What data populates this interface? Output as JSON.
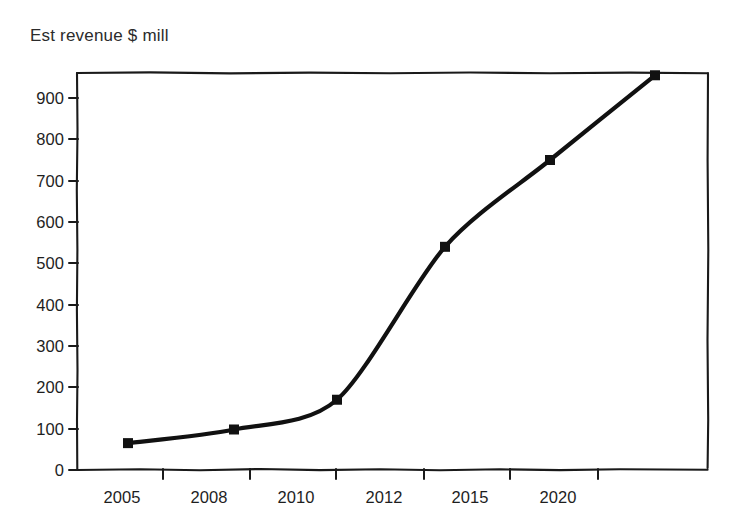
{
  "chart_data": {
    "type": "line",
    "title": "Est revenue $ mill",
    "xlabel": "",
    "ylabel": "",
    "categories": [
      "2005",
      "2008",
      "2010",
      "2012",
      "2015",
      "2020"
    ],
    "values": [
      65,
      98,
      170,
      540,
      750,
      955
    ],
    "series": [
      {
        "name": "Est revenue $ mill",
        "values": [
          65,
          98,
          170,
          540,
          750,
          955
        ]
      }
    ],
    "ylim": [
      0,
      960
    ],
    "y_ticks": [
      0,
      100,
      200,
      300,
      400,
      500,
      600,
      700,
      800,
      900
    ],
    "y_tick_labels": [
      "0",
      "100",
      "200",
      "300",
      "400",
      "500",
      "600",
      "700",
      "800",
      "900"
    ],
    "x_tick_labels": [
      "2005",
      "2008",
      "2010",
      "2012",
      "2015",
      "2020"
    ],
    "grid": false,
    "legend": "none",
    "line_color": "#111111",
    "marker": "square",
    "marker_color": "#111111",
    "background_color": "#ffffff",
    "axis_color": "#1a1a1a"
  },
  "chart": {
    "title": "Est revenue $ mill"
  }
}
